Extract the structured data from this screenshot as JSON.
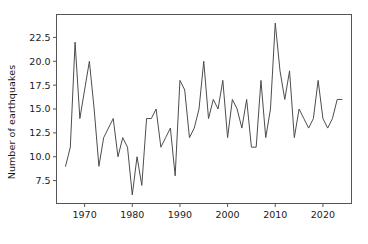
{
  "chart_data": {
    "type": "line",
    "title": "",
    "xlabel": "",
    "ylabel": "Number of earthquakes",
    "x": [
      1966,
      1967,
      1968,
      1969,
      1970,
      1971,
      1972,
      1973,
      1974,
      1975,
      1976,
      1977,
      1978,
      1979,
      1980,
      1981,
      1982,
      1983,
      1984,
      1985,
      1986,
      1987,
      1988,
      1989,
      1990,
      1991,
      1992,
      1993,
      1994,
      1995,
      1996,
      1997,
      1998,
      1999,
      2000,
      2001,
      2002,
      2003,
      2004,
      2005,
      2006,
      2007,
      2008,
      2009,
      2010,
      2011,
      2012,
      2013,
      2014,
      2015,
      2016,
      2017,
      2018,
      2019,
      2020,
      2021,
      2022,
      2023,
      2024
    ],
    "values": [
      9,
      11,
      22,
      14,
      17,
      20,
      15,
      9,
      12,
      13,
      14,
      10,
      12,
      11,
      6,
      10,
      7,
      14,
      14,
      15,
      11,
      12,
      13,
      8,
      18,
      17,
      12,
      13,
      15,
      20,
      14,
      16,
      15,
      18,
      12,
      16,
      15,
      13,
      16,
      11,
      11,
      18,
      12,
      15,
      24,
      19,
      16,
      19,
      12,
      15,
      14,
      13,
      14,
      18,
      14,
      13,
      14,
      16,
      16
    ],
    "xlim": [
      1964.1,
      2026.0
    ],
    "ylim": [
      5.1,
      24.9
    ],
    "xticks": [
      1970,
      1980,
      1990,
      2000,
      2010,
      2020
    ],
    "xticklabels": [
      "1970",
      "1980",
      "1990",
      "2000",
      "2010",
      "2020"
    ],
    "yticks": [
      7.5,
      10.0,
      12.5,
      15.0,
      17.5,
      20.0,
      22.5
    ],
    "yticklabels": [
      "7.5",
      "10.0",
      "12.5",
      "15.0",
      "17.5",
      "20.0",
      "22.5"
    ],
    "grid": false,
    "legend": null,
    "legend_position": "none",
    "line_color": "#4d4d4d",
    "line_width": 1.0,
    "axes_color": "#555555",
    "background_color": "#ffffff"
  }
}
